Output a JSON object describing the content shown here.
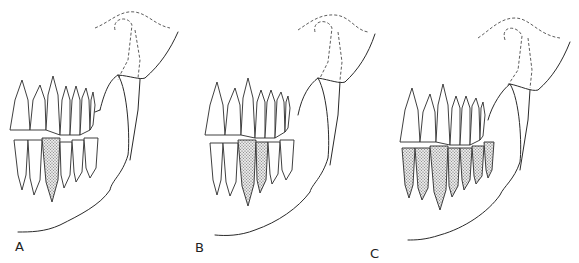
{
  "figure": {
    "type": "dental diagram",
    "panels": [
      {
        "label": "A",
        "shaded": "single lower tooth (canine region)"
      },
      {
        "label": "B",
        "shaded": "two lower teeth (canine and first premolar region)"
      },
      {
        "label": "C",
        "shaded": "all lower teeth"
      }
    ],
    "colors": {
      "line": "#2a2a2a",
      "stipple": "#555555",
      "background": "#ffffff"
    }
  }
}
